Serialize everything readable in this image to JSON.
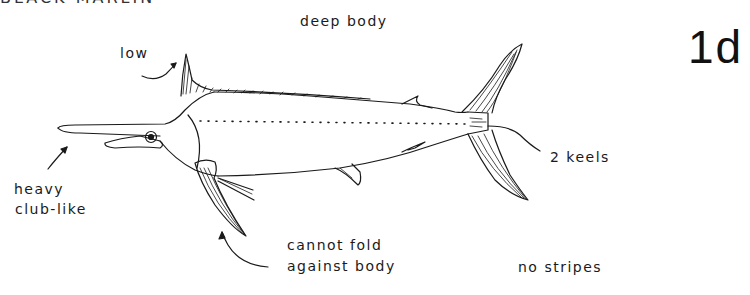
{
  "figure": {
    "clipped_title": "BLACK MARLIN",
    "number": "1d"
  },
  "labels": {
    "deep_body": "deep body",
    "low": "low",
    "heavy_line1": "heavy",
    "heavy_line2": "club-like",
    "cannot_fold_line1": "cannot fold",
    "cannot_fold_line2": "against body",
    "keels": "2 keels",
    "no_stripes": "no stripes"
  },
  "colors": {
    "ink": "#1a1a1a",
    "paper": "#ffffff"
  }
}
